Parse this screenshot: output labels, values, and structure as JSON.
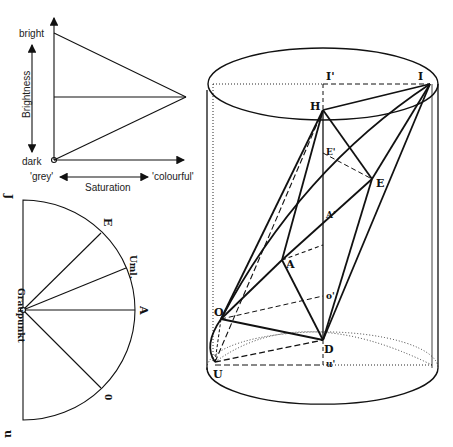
{
  "figure_a": {
    "title": "brightness-saturation triangle",
    "labels": {
      "bright": "bright",
      "dark": "dark",
      "brightness": "Brightness",
      "grey": "'grey'",
      "colourful": "'colourful'",
      "saturation": "Saturation"
    }
  },
  "figure_b": {
    "title": "semicircle hue fan",
    "labels": {
      "top": "J",
      "bottom": "u",
      "center": "Graupunkt",
      "rays": [
        "E",
        "Uml.",
        "A",
        "0"
      ]
    }
  },
  "figure_c": {
    "title": "color cylinder",
    "points": {
      "I": "I",
      "I_prime": "I'",
      "H": "H",
      "E_prime": "E'",
      "E": "E",
      "A_prime": "A'",
      "A": "A",
      "O": "O",
      "o_prime": "o'",
      "D": "D",
      "U": "U",
      "u_prime": "u'"
    }
  },
  "colors": {
    "ink": "#111111",
    "background": "#ffffff"
  }
}
